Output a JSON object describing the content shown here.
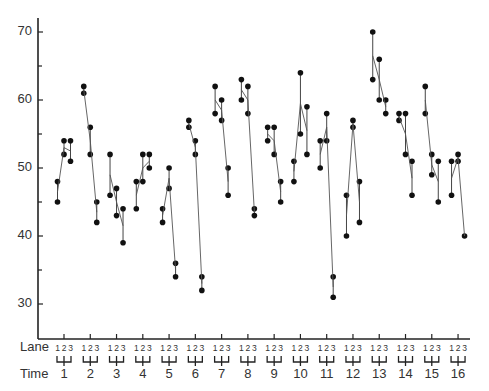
{
  "chart_data": {
    "type": "scatter",
    "title": "",
    "xlabel": "Time",
    "xlabel_secondary": "Lane",
    "ylabel": "",
    "ylim": [
      25,
      72
    ],
    "yticks_major": [
      30,
      40,
      50,
      60,
      70
    ],
    "yticks_minor": [
      35,
      45,
      55,
      65
    ],
    "lanes": [
      "1",
      "2",
      "3"
    ],
    "categories": [
      "1",
      "2",
      "3",
      "4",
      "5",
      "6",
      "7",
      "8",
      "9",
      "10",
      "11",
      "12",
      "13",
      "14",
      "15",
      "16"
    ],
    "grid": false,
    "legend": null,
    "groups": [
      {
        "time": "1",
        "lanes": [
          [
            48,
            45
          ],
          [
            54,
            52
          ],
          [
            54,
            51
          ]
        ]
      },
      {
        "time": "2",
        "lanes": [
          [
            62,
            61
          ],
          [
            56,
            52
          ],
          [
            45,
            42
          ]
        ]
      },
      {
        "time": "3",
        "lanes": [
          [
            52,
            46
          ],
          [
            47,
            43
          ],
          [
            44,
            39
          ]
        ]
      },
      {
        "time": "4",
        "lanes": [
          [
            48,
            44
          ],
          [
            52,
            48
          ],
          [
            52,
            50
          ]
        ]
      },
      {
        "time": "5",
        "lanes": [
          [
            44,
            42
          ],
          [
            50,
            47
          ],
          [
            36,
            34
          ]
        ]
      },
      {
        "time": "6",
        "lanes": [
          [
            57,
            56
          ],
          [
            54,
            52
          ],
          [
            34,
            32
          ]
        ]
      },
      {
        "time": "7",
        "lanes": [
          [
            62,
            58
          ],
          [
            60,
            57
          ],
          [
            50,
            46
          ]
        ]
      },
      {
        "time": "8",
        "lanes": [
          [
            63,
            60
          ],
          [
            62,
            58
          ],
          [
            44,
            43
          ]
        ]
      },
      {
        "time": "9",
        "lanes": [
          [
            56,
            54
          ],
          [
            56,
            52
          ],
          [
            48,
            45
          ]
        ]
      },
      {
        "time": "10",
        "lanes": [
          [
            51,
            48
          ],
          [
            64,
            55
          ],
          [
            59,
            52
          ]
        ]
      },
      {
        "time": "11",
        "lanes": [
          [
            54,
            50
          ],
          [
            58,
            54
          ],
          [
            34,
            31
          ]
        ]
      },
      {
        "time": "12",
        "lanes": [
          [
            46,
            40
          ],
          [
            57,
            56
          ],
          [
            48,
            42
          ]
        ]
      },
      {
        "time": "13",
        "lanes": [
          [
            70,
            63
          ],
          [
            66,
            60
          ],
          [
            60,
            58
          ]
        ]
      },
      {
        "time": "14",
        "lanes": [
          [
            58,
            57
          ],
          [
            58,
            52
          ],
          [
            51,
            46
          ]
        ]
      },
      {
        "time": "15",
        "lanes": [
          [
            62,
            58
          ],
          [
            52,
            49
          ],
          [
            51,
            45
          ]
        ]
      },
      {
        "time": "16",
        "lanes": [
          [
            51,
            46
          ],
          [
            52,
            51
          ],
          [
            40
          ]
        ]
      }
    ]
  },
  "labels": {
    "lane_row": "Lane",
    "time_row": "Time",
    "lane_digits": "1 2 3"
  },
  "colors": {
    "axis": "#222222",
    "point": "#111111",
    "line": "#555555",
    "text": "#333333"
  }
}
